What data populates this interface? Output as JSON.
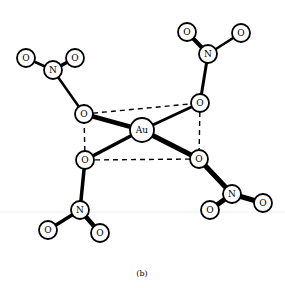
{
  "figure": {
    "caption": "(b)",
    "center_atom": {
      "label": "Au",
      "x": 142,
      "y": 130,
      "r": 12
    },
    "colors": {
      "ink": "#000000",
      "background": "#ffffff"
    },
    "square_plane": {
      "corners": [
        [
          84,
          114
        ],
        [
          200,
          103
        ],
        [
          199,
          159
        ],
        [
          85,
          160
        ]
      ]
    },
    "nitrate_groups": [
      {
        "name": "upper-left",
        "bridging_O": {
          "label": "O",
          "x": 84,
          "y": 114
        },
        "N": {
          "label": "N",
          "x": 53,
          "y": 70
        },
        "terminal_O": [
          {
            "label": "O",
            "x": 26,
            "y": 58
          },
          {
            "label": "O",
            "x": 75,
            "y": 58
          }
        ]
      },
      {
        "name": "upper-right",
        "bridging_O": {
          "label": "O",
          "x": 200,
          "y": 103
        },
        "N": {
          "label": "N",
          "x": 208,
          "y": 54
        },
        "terminal_O": [
          {
            "label": "O",
            "x": 187,
            "y": 32
          },
          {
            "label": "O",
            "x": 241,
            "y": 33
          }
        ]
      },
      {
        "name": "lower-left",
        "bridging_O": {
          "label": "O",
          "x": 85,
          "y": 160
        },
        "N": {
          "label": "N",
          "x": 80,
          "y": 210
        },
        "terminal_O": [
          {
            "label": "O",
            "x": 48,
            "y": 230
          },
          {
            "label": "O",
            "x": 100,
            "y": 233
          }
        ]
      },
      {
        "name": "lower-right",
        "bridging_O": {
          "label": "O",
          "x": 199,
          "y": 159
        },
        "N": {
          "label": "N",
          "x": 232,
          "y": 194
        },
        "terminal_O": [
          {
            "label": "O",
            "x": 263,
            "y": 203
          },
          {
            "label": "O",
            "x": 210,
            "y": 210
          }
        ]
      }
    ]
  }
}
